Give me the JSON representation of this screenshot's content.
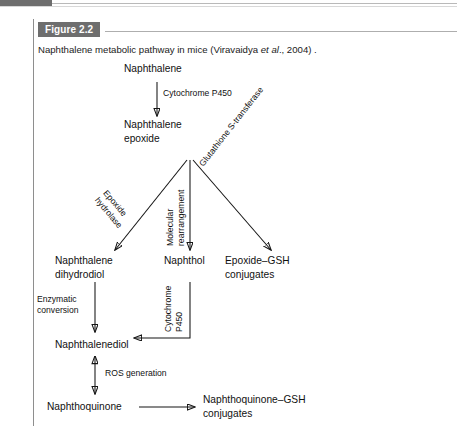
{
  "figure": {
    "badge_label": "Figure 2.2",
    "caption_prefix": "Naphthalene metabolic pathway in mice (Viravaidya ",
    "caption_italic": "et al",
    "caption_suffix": "., 2004) ."
  },
  "colors": {
    "badge_background": "#6e6e6e",
    "badge_text": "#ffffff",
    "rule": "#aeaeae",
    "left_rule": "#8e8e8e",
    "ink": "#111111",
    "page_background": "#ffffff"
  },
  "diagram": {
    "title": "Naphthalene metabolic pathway in mice",
    "type": "flowchart",
    "nodes": [
      {
        "id": "naphthalene",
        "label": "Naphthalene"
      },
      {
        "id": "naphthalene-epoxide",
        "label_line1": "Naphthalene",
        "label_line2": "epoxide"
      },
      {
        "id": "naphthalene-dihydrodiol",
        "label_line1": "Naphthalene",
        "label_line2": "dihydrodiol"
      },
      {
        "id": "naphthol",
        "label": "Naphthol"
      },
      {
        "id": "epoxide-gsh-conjugates",
        "label_line1": "Epoxide–GSH",
        "label_line2": "conjugates"
      },
      {
        "id": "naphthalenediol",
        "label": "Naphthalenediol"
      },
      {
        "id": "naphthoquinone",
        "label": "Naphthoquinone"
      },
      {
        "id": "naphthoquinone-gsh-conjugates",
        "label_line1": "Naphthoquinone–GSH",
        "label_line2": "conjugates"
      }
    ],
    "edges": [
      {
        "id": "e1",
        "from": "naphthalene",
        "to": "naphthalene-epoxide",
        "label": "Cytochrome P450",
        "direction": "down"
      },
      {
        "id": "e2",
        "from": "naphthalene-epoxide",
        "to": "naphthalene-dihydrodiol",
        "label_line1": "Epoxide",
        "label_line2": "hydrolase",
        "direction": "down-left"
      },
      {
        "id": "e3",
        "from": "naphthalene-epoxide",
        "to": "naphthol",
        "label_line1": "Molecular",
        "label_line2": "rearrangement",
        "direction": "down"
      },
      {
        "id": "e4",
        "from": "naphthalene-epoxide",
        "to": "epoxide-gsh-conjugates",
        "label": "Glutathione S-transferase",
        "direction": "down-right"
      },
      {
        "id": "e5",
        "from": "naphthalene-dihydrodiol",
        "to": "naphthalenediol",
        "label_line1": "Enzymatic",
        "label_line2": "conversion",
        "direction": "down"
      },
      {
        "id": "e6",
        "from": "naphthol",
        "to": "naphthalenediol",
        "label_line1": "Cytochrome",
        "label_line2": "P450",
        "direction": "down-then-left"
      },
      {
        "id": "e7",
        "from": "naphthalenediol",
        "to": "naphthoquinone",
        "label": "ROS generation",
        "direction": "bidirectional"
      },
      {
        "id": "e8",
        "from": "naphthoquinone",
        "to": "naphthoquinone-gsh-conjugates",
        "label": "",
        "direction": "right"
      }
    ]
  }
}
